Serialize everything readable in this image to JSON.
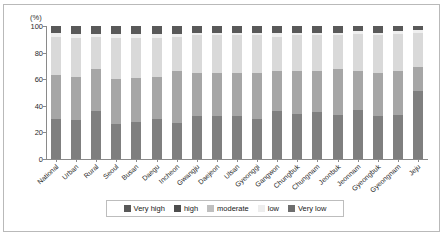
{
  "chart_data": {
    "type": "bar",
    "title": "",
    "subtitle": "",
    "xlabel": "",
    "ylabel": "(%)",
    "unit_label": "(%)",
    "ylim": [
      0,
      100
    ],
    "yticks": [
      0,
      20,
      40,
      60,
      80,
      100
    ],
    "ytick_labels": [
      "0",
      "20",
      "40",
      "60",
      "80",
      "100"
    ],
    "grid": false,
    "stacked": true,
    "stack_total": 100,
    "legend_position": "bottom",
    "categories": [
      "National",
      "Urban",
      "Rural",
      "Seoul",
      "Busan",
      "Daegu",
      "Incheon",
      "Gwangju",
      "Daejeon",
      "Ulsan",
      "Gyeonggi",
      "Gangwon",
      "Chungbuk",
      "Chungnam",
      "Jeonbuk",
      "Jeonnam",
      "Gyeongbuk",
      "Gyeongnam",
      "Jeju"
    ],
    "series": [
      {
        "name": "Very low",
        "color": "#7f7f7f",
        "values": [
          30,
          29,
          36,
          26,
          28,
          30,
          27,
          32,
          32,
          32,
          30,
          36,
          34,
          35,
          33,
          37,
          32,
          33,
          51
        ]
      },
      {
        "name": "low",
        "color": "#a6a6a6",
        "values": [
          33,
          33,
          32,
          34,
          33,
          32,
          39,
          33,
          33,
          33,
          35,
          30,
          32,
          31,
          35,
          29,
          33,
          33,
          18
        ]
      },
      {
        "name": "moderate",
        "color": "#d9d9d9",
        "values": [
          29,
          29,
          24,
          31,
          30,
          29,
          26,
          28,
          28,
          28,
          28,
          26,
          27,
          27,
          25,
          28,
          28,
          28,
          26
        ]
      },
      {
        "name": "high",
        "color": "#efefef",
        "values": [
          3,
          3,
          2,
          3,
          3,
          3,
          2,
          2,
          2,
          2,
          2,
          3,
          2,
          2,
          2,
          2,
          2,
          2,
          2
        ]
      },
      {
        "name": "Very high",
        "color": "#595959",
        "values": [
          5,
          6,
          6,
          6,
          6,
          6,
          6,
          5,
          5,
          5,
          5,
          5,
          5,
          5,
          5,
          4,
          5,
          4,
          3
        ]
      }
    ],
    "legend": [
      {
        "label": "Very high",
        "color": "#595959"
      },
      {
        "label": "high",
        "color": "#4d4d4d"
      },
      {
        "label": "moderate",
        "color": "#bfbfbf"
      },
      {
        "label": "low",
        "color": "#ededed"
      },
      {
        "label": "Very low",
        "color": "#6e6e6e"
      }
    ]
  }
}
